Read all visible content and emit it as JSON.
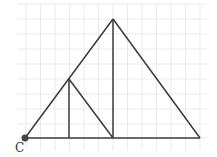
{
  "diagram": {
    "type": "geometry-figure",
    "grid": {
      "x_start": 17,
      "x_end": 207,
      "y_start": 4,
      "y_end": 150,
      "vertical_lines": [
        26,
        40.5,
        55,
        69.5,
        84,
        98.5,
        113,
        127.5,
        142,
        156.5,
        171,
        185.5,
        200
      ],
      "horizontal_lines": [
        4,
        19,
        34,
        49,
        64,
        79,
        94,
        109,
        124,
        138
      ]
    },
    "points": {
      "C": {
        "x": 25,
        "y": 138,
        "label": "C"
      },
      "apex": {
        "x": 113,
        "y": 19
      },
      "right_base": {
        "x": 200,
        "y": 138
      },
      "inner_top": {
        "x": 69,
        "y": 79
      },
      "inner_foot": {
        "x": 69,
        "y": 138
      },
      "mid_base": {
        "x": 113,
        "y": 138
      }
    },
    "labels": {
      "C": "C"
    },
    "colors": {
      "line": "#3a3a3a",
      "grid": "#e6e6e6",
      "point": "#444444"
    }
  }
}
